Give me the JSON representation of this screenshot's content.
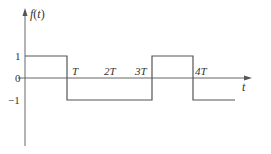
{
  "diagram": {
    "y_axis_label": "f(t)",
    "x_axis_label": "t",
    "y_ticks": [
      {
        "label": "1",
        "value": 1
      },
      {
        "label": "0",
        "value": 0
      },
      {
        "label": "−1",
        "value": -1
      }
    ],
    "x_ticks": [
      {
        "label": "T"
      },
      {
        "label": "2T"
      },
      {
        "label": "3T"
      },
      {
        "label": "4T"
      }
    ],
    "waveform": {
      "segments": [
        {
          "from": "0",
          "to": "T",
          "value": 1
        },
        {
          "from": "T",
          "to": "3T",
          "value": -1
        },
        {
          "from": "3T",
          "to": "4T",
          "value": 1
        },
        {
          "from": "4T",
          "to": "5T",
          "value": -1
        }
      ]
    },
    "colors": {
      "axis": "#666666",
      "wave": "#555555",
      "text": "#333333"
    }
  }
}
